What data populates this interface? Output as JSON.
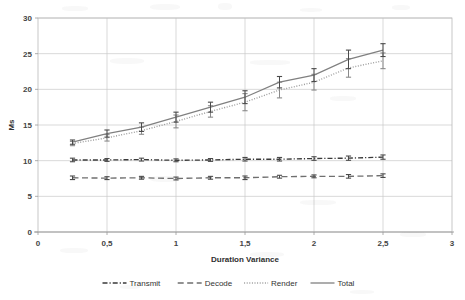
{
  "chart_data": {
    "type": "line",
    "title": "",
    "subtitle": "",
    "xlabel": "Duration Variance",
    "ylabel": "Ms",
    "xlim": [
      0,
      3
    ],
    "ylim": [
      0,
      30
    ],
    "xticks": [
      0,
      0.5,
      1,
      1.5,
      2,
      2.5,
      3
    ],
    "xtick_labels": [
      "0",
      "0,5",
      "1",
      "1,5",
      "2",
      "2,5",
      "3"
    ],
    "yticks": [
      0,
      5,
      10,
      15,
      20,
      25,
      30
    ],
    "ytick_labels": [
      "0",
      "5",
      "10",
      "15",
      "20",
      "25",
      "30"
    ],
    "grid": "horizontal-and-vertical",
    "legend_position": "bottom-center",
    "x": [
      0.25,
      0.5,
      0.75,
      1.0,
      1.25,
      1.5,
      1.75,
      2.0,
      2.25,
      2.5
    ],
    "series": [
      {
        "name": "Transmit",
        "style": "dash-dot",
        "color": "#3a3a3a",
        "values": [
          10.1,
          10.1,
          10.15,
          10.05,
          10.1,
          10.2,
          10.2,
          10.3,
          10.35,
          10.5
        ],
        "errors": [
          0.25,
          0.2,
          0.2,
          0.2,
          0.2,
          0.25,
          0.25,
          0.25,
          0.3,
          0.3
        ]
      },
      {
        "name": "Decode",
        "style": "long-dash",
        "color": "#6f6f6f",
        "values": [
          7.6,
          7.55,
          7.6,
          7.5,
          7.6,
          7.6,
          7.75,
          7.8,
          7.8,
          7.9
        ],
        "errors": [
          0.25,
          0.2,
          0.2,
          0.2,
          0.2,
          0.25,
          0.2,
          0.2,
          0.25,
          0.25
        ]
      },
      {
        "name": "Render",
        "style": "dotted",
        "color": "#9b9b9b",
        "values": [
          12.4,
          13.2,
          14.2,
          15.5,
          16.9,
          18.2,
          19.9,
          21.0,
          23.0,
          24.0
        ],
        "errors": [
          0.3,
          0.45,
          0.5,
          0.9,
          0.8,
          1.2,
          1.1,
          1.1,
          1.3,
          1.1
        ]
      },
      {
        "name": "Total",
        "style": "solid",
        "color": "#808080",
        "values": [
          12.6,
          13.8,
          14.7,
          16.1,
          17.5,
          18.9,
          21.0,
          22.0,
          24.2,
          25.5
        ],
        "errors": [
          0.3,
          0.5,
          0.6,
          0.7,
          0.7,
          0.9,
          0.8,
          0.9,
          1.3,
          0.9
        ]
      }
    ]
  },
  "legend": {
    "items": [
      {
        "label": "Transmit"
      },
      {
        "label": "Decode"
      },
      {
        "label": "Render"
      },
      {
        "label": "Total"
      }
    ]
  }
}
